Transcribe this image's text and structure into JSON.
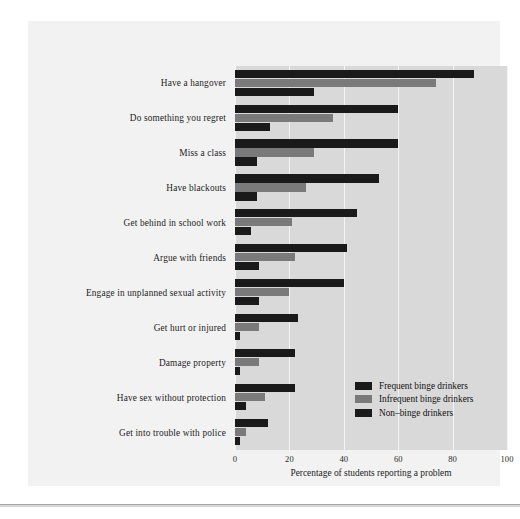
{
  "figure": {
    "background_color": "#f2f2f2",
    "plot_background_color": "#d9d9d9",
    "gridline_color": "#f4f4f4"
  },
  "legend": {
    "position": "inside-bottom-right",
    "entries": [
      {
        "label": "Frequent binge drinkers",
        "color": "#1a1a1a"
      },
      {
        "label": "Infrequent binge drinkers",
        "color": "#7a7a7a"
      },
      {
        "label": "Non–binge drinkers",
        "color": "#1a1a1a"
      }
    ]
  },
  "axis": {
    "x_title": "Percentage of students reporting a problem",
    "x_ticks": [
      "0",
      "20",
      "40",
      "60",
      "80",
      "100"
    ]
  },
  "chart_data": {
    "type": "bar",
    "orientation": "horizontal",
    "title": "",
    "xlabel": "Percentage of students reporting a problem",
    "ylabel": "",
    "xlim": [
      0,
      100
    ],
    "grid": true,
    "legend_position": "inside-bottom-right",
    "categories": [
      "Have a hangover",
      "Do something you regret",
      "Miss a class",
      "Have blackouts",
      "Get behind in school work",
      "Argue with friends",
      "Engage in unplanned sexual activity",
      "Get hurt or injured",
      "Damage property",
      "Have sex without protection",
      "Get into trouble with police"
    ],
    "series": [
      {
        "name": "Frequent binge drinkers",
        "color": "#1a1a1a",
        "values": [
          88,
          60,
          60,
          53,
          45,
          41,
          40,
          23,
          22,
          22,
          12
        ]
      },
      {
        "name": "Infrequent binge drinkers",
        "color": "#7a7a7a",
        "values": [
          74,
          36,
          29,
          26,
          21,
          22,
          20,
          9,
          9,
          11,
          4
        ]
      },
      {
        "name": "Non–binge drinkers",
        "color": "#1a1a1a",
        "values": [
          29,
          13,
          8,
          8,
          6,
          9,
          9,
          2,
          2,
          4,
          2
        ]
      }
    ]
  }
}
